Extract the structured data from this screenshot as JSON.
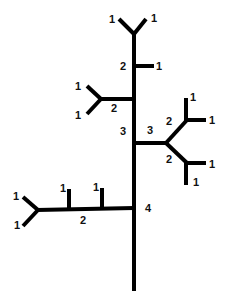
{
  "diagram": {
    "type": "stream-order-tree",
    "stroke_color": "#000000",
    "background": "#ffffff",
    "segments": [
      {
        "id": "trunk",
        "x1": 134,
        "y1": 33,
        "x2": 134,
        "y2": 291
      },
      {
        "id": "top-fork-left",
        "x1": 134,
        "y1": 34,
        "x2": 119,
        "y2": 19
      },
      {
        "id": "top-fork-right",
        "x1": 134,
        "y1": 34,
        "x2": 146,
        "y2": 19
      },
      {
        "id": "upper-right-stub",
        "x1": 134,
        "y1": 66,
        "x2": 154,
        "y2": 66
      },
      {
        "id": "upper-left-branch",
        "x1": 134,
        "y1": 99,
        "x2": 101,
        "y2": 99
      },
      {
        "id": "upper-left-fork-up",
        "x1": 101,
        "y1": 99,
        "x2": 87,
        "y2": 86
      },
      {
        "id": "upper-left-fork-down",
        "x1": 101,
        "y1": 99,
        "x2": 87,
        "y2": 114
      },
      {
        "id": "mid-right-branch",
        "x1": 134,
        "y1": 143,
        "x2": 166,
        "y2": 143
      },
      {
        "id": "mid-right-up-diag",
        "x1": 166,
        "y1": 143,
        "x2": 187,
        "y2": 120
      },
      {
        "id": "mid-right-down-diag",
        "x1": 166,
        "y1": 143,
        "x2": 187,
        "y2": 163
      },
      {
        "id": "upper-sub-vertical",
        "x1": 186,
        "y1": 121,
        "x2": 186,
        "y2": 98
      },
      {
        "id": "upper-sub-horizontal",
        "x1": 186,
        "y1": 120,
        "x2": 206,
        "y2": 120
      },
      {
        "id": "lower-sub-horizontal",
        "x1": 186,
        "y1": 163,
        "x2": 206,
        "y2": 163
      },
      {
        "id": "lower-sub-vertical",
        "x1": 186,
        "y1": 162,
        "x2": 186,
        "y2": 185
      },
      {
        "id": "lower-left-branch",
        "x1": 134,
        "y1": 208,
        "x2": 37,
        "y2": 210
      },
      {
        "id": "lower-left-fork-up",
        "x1": 38,
        "y1": 210,
        "x2": 23,
        "y2": 197
      },
      {
        "id": "lower-left-fork-down",
        "x1": 38,
        "y1": 210,
        "x2": 23,
        "y2": 226
      },
      {
        "id": "lower-left-tick-1",
        "x1": 69,
        "y1": 210,
        "x2": 69,
        "y2": 189
      },
      {
        "id": "lower-left-tick-2",
        "x1": 102,
        "y1": 209,
        "x2": 102,
        "y2": 188
      }
    ],
    "labels": [
      {
        "text": "1",
        "x": 109,
        "y": 23
      },
      {
        "text": "1",
        "x": 151,
        "y": 22
      },
      {
        "text": "2",
        "x": 120,
        "y": 70
      },
      {
        "text": "1",
        "x": 156,
        "y": 70
      },
      {
        "text": "1",
        "x": 75,
        "y": 90
      },
      {
        "text": "1",
        "x": 75,
        "y": 119
      },
      {
        "text": "2",
        "x": 111,
        "y": 112
      },
      {
        "text": "3",
        "x": 120,
        "y": 135
      },
      {
        "text": "3",
        "x": 147,
        "y": 134
      },
      {
        "text": "2",
        "x": 166,
        "y": 125
      },
      {
        "text": "1",
        "x": 190,
        "y": 101
      },
      {
        "text": "1",
        "x": 209,
        "y": 124
      },
      {
        "text": "2",
        "x": 166,
        "y": 163
      },
      {
        "text": "1",
        "x": 209,
        "y": 168
      },
      {
        "text": "1",
        "x": 193,
        "y": 186
      },
      {
        "text": "4",
        "x": 145,
        "y": 212
      },
      {
        "text": "1",
        "x": 60,
        "y": 192
      },
      {
        "text": "1",
        "x": 93,
        "y": 191
      },
      {
        "text": "1",
        "x": 13,
        "y": 200
      },
      {
        "text": "1",
        "x": 14,
        "y": 229
      },
      {
        "text": "2",
        "x": 80,
        "y": 224
      }
    ]
  }
}
